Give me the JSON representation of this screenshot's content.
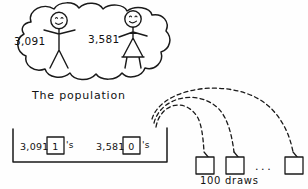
{
  "diagram": {
    "title_caption": "The population",
    "population": {
      "person_left": {
        "label": "3,091",
        "icon": "stick-figure-arms-up"
      },
      "person_right": {
        "label": "3,581",
        "icon": "stick-figure-dress"
      }
    },
    "box_model": {
      "tickets": [
        {
          "count": "3,091",
          "value": "1",
          "suffix": "'s"
        },
        {
          "count": "3,581",
          "value": "0",
          "suffix": "'s"
        }
      ]
    },
    "draws": {
      "caption": "100 draws",
      "ellipsis": "...",
      "count_visible": 3
    },
    "colors": {
      "ink": "#1a1a1a",
      "paper": "#fefefe"
    }
  }
}
